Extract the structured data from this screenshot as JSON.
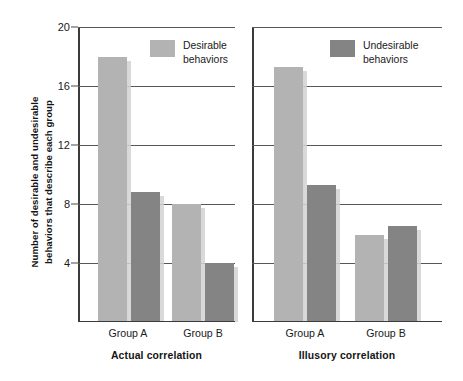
{
  "chart_data": {
    "type": "bar",
    "title": "",
    "xlabel": "",
    "ylabel": "Number of desirable and undesirable behaviors that describe each group",
    "ylabel_line1": "Number of desirable and undesirable",
    "ylabel_line2": "behaviors that describe each group",
    "ylim": [
      0,
      20
    ],
    "yticks": [
      20,
      16,
      12,
      8,
      4
    ],
    "ytick_labels": [
      "20",
      "16",
      "12",
      "8",
      "4"
    ],
    "grid": true,
    "legend_position": "inside-top-right-of-each-panel",
    "categories": [
      "Group A",
      "Group B"
    ],
    "series": [
      {
        "name": "Desirable behaviors",
        "color": "#b3b3b3"
      },
      {
        "name": "Undesirable behaviors",
        "color": "#848484"
      }
    ],
    "panels": [
      {
        "title": "Actual correlation",
        "categories": [
          "Group A",
          "Group B"
        ],
        "series": [
          {
            "name": "Desirable behaviors",
            "values": [
              18.0,
              8.0
            ]
          },
          {
            "name": "Undesirable behaviors",
            "values": [
              8.8,
              4.0
            ]
          }
        ]
      },
      {
        "title": "Illusory correlation",
        "categories": [
          "Group A",
          "Group B"
        ],
        "series": [
          {
            "name": "Desirable behaviors",
            "values": [
              17.3,
              5.9
            ]
          },
          {
            "name": "Undesirable behaviors",
            "values": [
              9.3,
              6.5
            ]
          }
        ]
      }
    ]
  },
  "axis": {
    "y_title_line1": "Number of desirable and undesirable",
    "y_title_line2": "behaviors that describe each group",
    "ticks": [
      "20",
      "16",
      "12",
      "8",
      "4"
    ]
  },
  "panel_left": {
    "title": "Actual correlation",
    "group_a_label": "Group A",
    "group_b_label": "Group B",
    "legend": {
      "label_line1": "Desirable",
      "label_line2": "behaviors"
    }
  },
  "panel_right": {
    "title": "Illusory correlation",
    "group_a_label": "Group A",
    "group_b_label": "Group B",
    "legend": {
      "label_line1": "Undesirable",
      "label_line2": "behaviors"
    }
  },
  "colors": {
    "desirable": "#b3b3b3",
    "undesirable": "#848484",
    "axis": "#3b3b3b",
    "grid": "#55585c",
    "background": "#ffffff",
    "text": "#1a1a1a"
  }
}
